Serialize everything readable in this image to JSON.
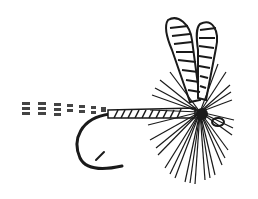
{
  "image": {
    "subject": "Dry fishing fly illustration",
    "style": "black-and-white engraving",
    "colors": {
      "ink": "#1a1a1a",
      "background": "#ffffff"
    }
  }
}
